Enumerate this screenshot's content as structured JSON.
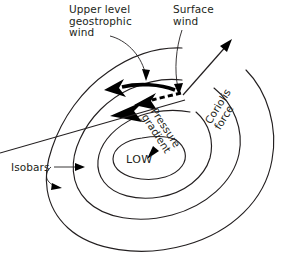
{
  "diagram": {
    "background_color": "#ffffff",
    "ink_color": "#231f20",
    "labels": {
      "upper_level_geostrophic_wind": "Upper level\ngeostrophic\nwind",
      "surface_wind": "Surface\nwind",
      "coriolis_force": "Coriolis\nforce",
      "pressure_gradient": "Pressure\ngradient",
      "isobars": "Isobars",
      "low": "LOW"
    },
    "elements": {
      "isobar_count": 4,
      "geostrophic_wind_arrow": "thick solid curved arrow pointing left",
      "surface_wind_arrow": "dashed arrow pointing left and inward",
      "coriolis_force_arrow": "thin arrow pointing up-right",
      "pressure_gradient_arrow": "thin arrow pointing down-left toward LOW",
      "isobar_pointer_straight": "straight arrow to isobar",
      "isobar_pointer_curved": "curved arrow to outer isobar"
    }
  }
}
